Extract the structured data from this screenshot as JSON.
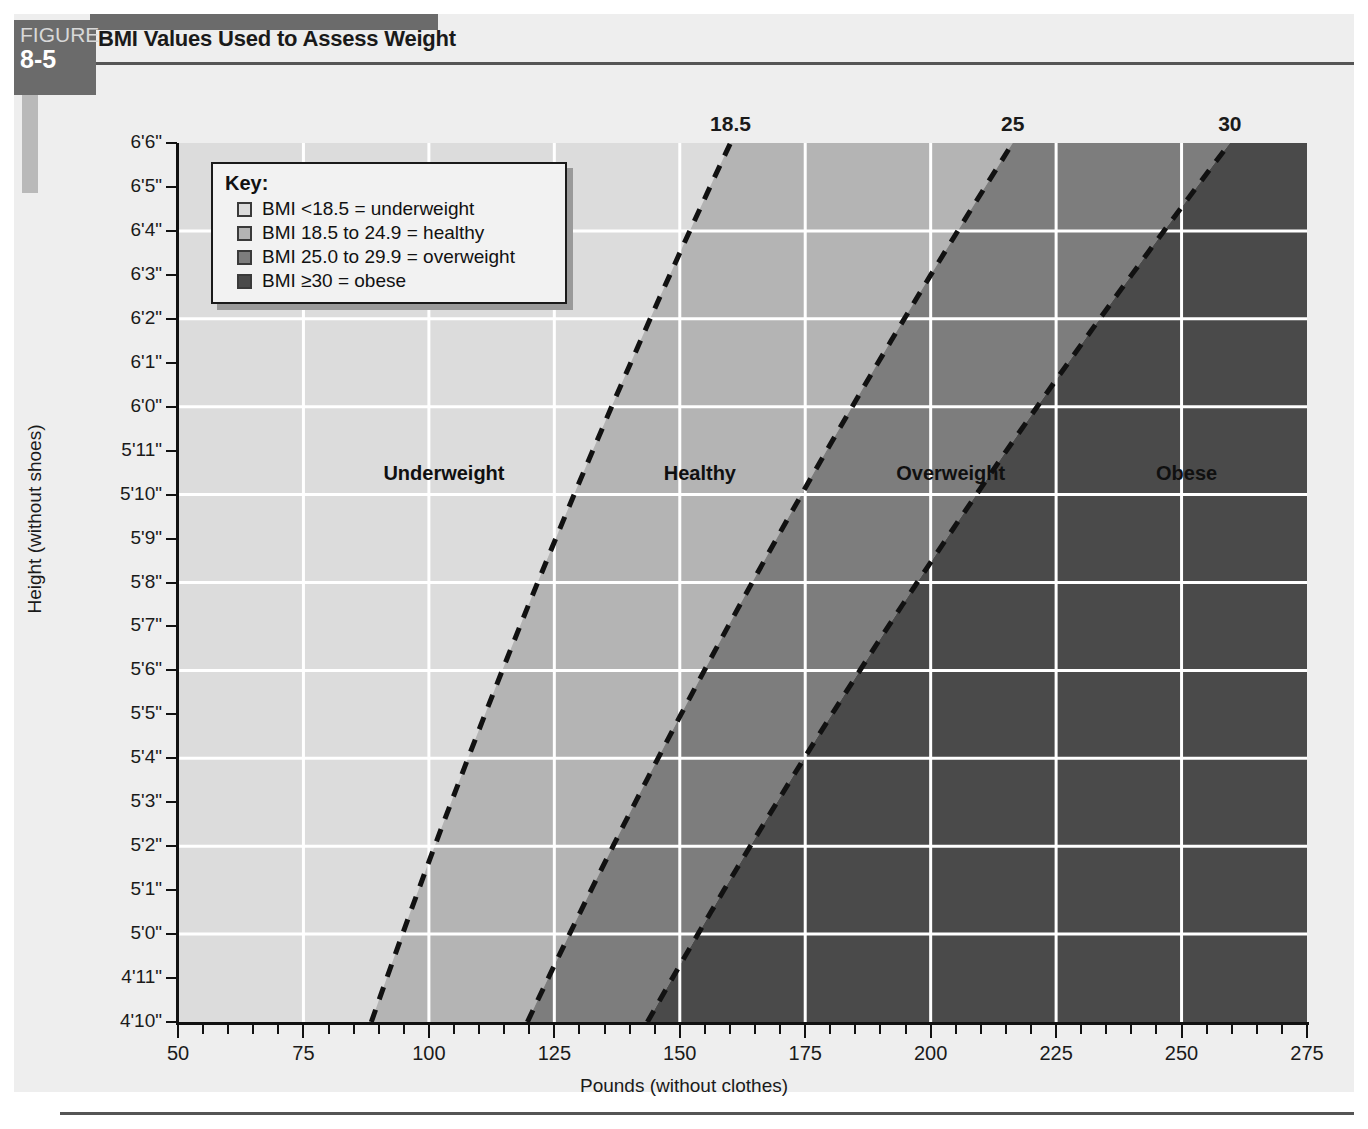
{
  "figure": {
    "tab_word": "FIGURE",
    "tab_number": "8-5",
    "title": "BMI Values Used to Assess Weight"
  },
  "key": {
    "title": "Key:",
    "items": [
      {
        "label": "BMI <18.5 = underweight",
        "color": "#dcdcdc"
      },
      {
        "label": "BMI 18.5 to 24.9 = healthy",
        "color": "#b4b4b4"
      },
      {
        "label": "BMI 25.0 to 29.9 = overweight",
        "color": "#7d7d7d"
      },
      {
        "label": "BMI ≥30 = obese",
        "color": "#4a4a4a"
      }
    ]
  },
  "axes": {
    "x_title": "Pounds (without clothes)",
    "y_title": "Height (without shoes)",
    "x_labels": [
      "50",
      "75",
      "100",
      "125",
      "150",
      "175",
      "200",
      "225",
      "250",
      "275"
    ],
    "y_labels": [
      "6'6\"",
      "6'5\"",
      "6'4\"",
      "6'3\"",
      "6'2\"",
      "6'1\"",
      "6'0\"",
      "5'11\"",
      "5'10\"",
      "5'9\"",
      "5'8\"",
      "5'7\"",
      "5'6\"",
      "5'5\"",
      "5'4\"",
      "5'3\"",
      "5'2\"",
      "5'1\"",
      "5'0\"",
      "4'11\"",
      "4'10\""
    ]
  },
  "boundary_labels": [
    "18.5",
    "25",
    "30"
  ],
  "region_labels": [
    "Underweight",
    "Healthy",
    "Overweight",
    "Obese"
  ],
  "chart_data": {
    "type": "area",
    "title": "BMI Values Used to Assess Weight",
    "xlabel": "Pounds (without clothes)",
    "ylabel": "Height (without shoes)",
    "xlim": [
      50,
      275
    ],
    "ylim_inches": [
      58,
      78
    ],
    "ylim_labels": [
      "4'10\"",
      "6'6\""
    ],
    "x_ticks": [
      50,
      75,
      100,
      125,
      150,
      175,
      200,
      225,
      250,
      275
    ],
    "x_minor_tick_step": 5,
    "y_ticks_inches": [
      58,
      59,
      60,
      61,
      62,
      63,
      64,
      65,
      66,
      67,
      68,
      69,
      70,
      71,
      72,
      73,
      74,
      75,
      76,
      77,
      78
    ],
    "grid": true,
    "grid_color": "#ffffff",
    "grid_x_step": 25,
    "grid_y_step_inches": 2,
    "legend_position": "inside-top-left",
    "regions": [
      {
        "name": "Underweight",
        "bmi_range": "<18.5",
        "color": "#dcdcdc"
      },
      {
        "name": "Healthy",
        "bmi_range": "18.5 to 24.9",
        "color": "#b4b4b4"
      },
      {
        "name": "Overweight",
        "bmi_range": "25.0 to 29.9",
        "color": "#7d7d7d"
      },
      {
        "name": "Obese",
        "bmi_range": "≥30",
        "color": "#4a4a4a"
      }
    ],
    "boundary_lines": [
      {
        "bmi": 18.5,
        "label": "18.5",
        "style": "dashed",
        "color": "#111111",
        "points_lbs_at_height_in": [
          {
            "height_in": 58,
            "lbs": 88
          },
          {
            "height_in": 64,
            "lbs": 108
          },
          {
            "height_in": 70,
            "lbs": 129
          },
          {
            "height_in": 78,
            "lbs": 160
          }
        ]
      },
      {
        "bmi": 25,
        "label": "25",
        "style": "dashed",
        "color": "#111111",
        "points_lbs_at_height_in": [
          {
            "height_in": 58,
            "lbs": 119
          },
          {
            "height_in": 64,
            "lbs": 146
          },
          {
            "height_in": 70,
            "lbs": 174
          },
          {
            "height_in": 78,
            "lbs": 216
          }
        ]
      },
      {
        "bmi": 30,
        "label": "30",
        "style": "dashed",
        "color": "#111111",
        "points_lbs_at_height_in": [
          {
            "height_in": 58,
            "lbs": 143
          },
          {
            "height_in": 64,
            "lbs": 175
          },
          {
            "height_in": 70,
            "lbs": 209
          },
          {
            "height_in": 78,
            "lbs": 259
          }
        ]
      }
    ],
    "region_label_positions": [
      {
        "label": "Underweight",
        "lbs": 103,
        "height_in": 70
      },
      {
        "label": "Healthy",
        "lbs": 154,
        "height_in": 70
      },
      {
        "label": "Overweight",
        "lbs": 204,
        "height_in": 70
      },
      {
        "label": "Obese",
        "lbs": 251,
        "height_in": 70
      }
    ]
  }
}
